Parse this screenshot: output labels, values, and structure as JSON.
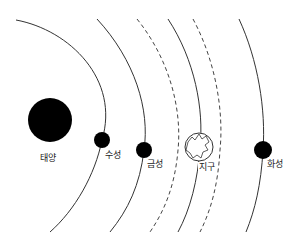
{
  "diagram": {
    "title": "",
    "colors": {
      "planet": "#000000",
      "orbit": "#333333",
      "earth_fill": "#ffffff"
    },
    "sun": {
      "label": "태양"
    },
    "planets": [
      {
        "name": "mercury",
        "label": "수성"
      },
      {
        "name": "venus",
        "label": "금성"
      },
      {
        "name": "earth",
        "label": "지구"
      },
      {
        "name": "mars",
        "label": "화성"
      }
    ],
    "orbits": [
      {
        "style": "solid",
        "belongs_to": "수성"
      },
      {
        "style": "solid",
        "belongs_to": "금성"
      },
      {
        "style": "dashed"
      },
      {
        "style": "solid",
        "belongs_to": "지구"
      },
      {
        "style": "dashed"
      },
      {
        "style": "solid",
        "belongs_to": "화성"
      }
    ]
  }
}
